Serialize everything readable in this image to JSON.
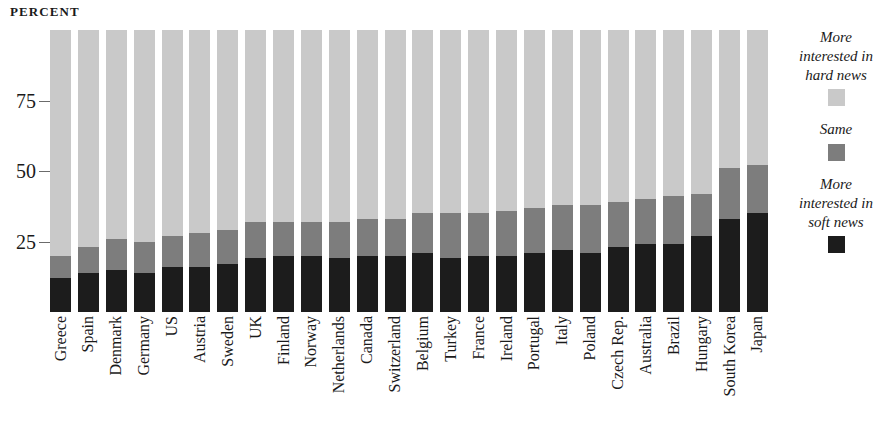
{
  "axis_unit_label": "PERCENT",
  "colors": {
    "hard": "#c9c9c9",
    "same": "#7d7d7d",
    "soft": "#1c1c1c",
    "text": "#1a1a1a",
    "background": "#ffffff"
  },
  "legend": {
    "items": [
      {
        "label": "More interested in hard news",
        "key": "hard",
        "swatch_color": "#c9c9c9"
      },
      {
        "label": "Same",
        "key": "same",
        "swatch_color": "#7d7d7d"
      },
      {
        "label": "More interested in soft news",
        "key": "soft",
        "swatch_color": "#1c1c1c"
      }
    ]
  },
  "chart_data": {
    "type": "bar",
    "subtype": "stacked-bar-100",
    "title": "",
    "subtitle": "",
    "xlabel": "",
    "ylabel": "PERCENT",
    "ylim": [
      0,
      100
    ],
    "yticks": [
      25,
      50,
      75
    ],
    "ytick_labels": [
      "25",
      "50",
      "75"
    ],
    "grid": false,
    "legend_position": "right",
    "orientation": "vertical",
    "categories": [
      "Greece",
      "Spain",
      "Denmark",
      "Germany",
      "US",
      "Austria",
      "Sweden",
      "UK",
      "Finland",
      "Norway",
      "Netherlands",
      "Canada",
      "Switzerland",
      "Belgium",
      "Turkey",
      "France",
      "Ireland",
      "Portugal",
      "Italy",
      "Poland",
      "Czech Rep.",
      "Australia",
      "Brazil",
      "Hungary",
      "South Korea",
      "Japan"
    ],
    "series": [
      {
        "name": "More interested in soft news",
        "color": "#1c1c1c",
        "values": [
          12,
          14,
          15,
          14,
          16,
          16,
          17,
          19,
          20,
          20,
          19,
          20,
          20,
          21,
          19,
          20,
          20,
          21,
          22,
          21,
          23,
          24,
          24,
          27,
          33,
          35
        ]
      },
      {
        "name": "Same",
        "color": "#7d7d7d",
        "values": [
          8,
          9,
          11,
          11,
          11,
          12,
          12,
          13,
          12,
          12,
          13,
          13,
          13,
          14,
          16,
          15,
          16,
          16,
          16,
          17,
          16,
          16,
          17,
          15,
          18,
          17
        ]
      },
      {
        "name": "More interested in hard news",
        "color": "#c9c9c9",
        "values": [
          80,
          77,
          74,
          75,
          73,
          72,
          71,
          68,
          68,
          68,
          68,
          67,
          67,
          65,
          65,
          65,
          64,
          63,
          62,
          62,
          61,
          60,
          59,
          58,
          49,
          48
        ]
      }
    ]
  }
}
